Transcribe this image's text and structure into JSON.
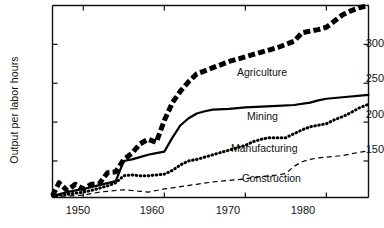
{
  "chart_data": {
    "type": "line",
    "title": "",
    "xlabel": "",
    "ylabel": "Output per labor hours",
    "xlim": [
      1946.2,
      1985.2
    ],
    "ylim": [
      103,
      350
    ],
    "grid": false,
    "legend_position": "inline-right",
    "xticks": [
      1950,
      1960,
      1970,
      1980
    ],
    "xtick_labels": [
      "1950",
      "1960",
      "1970",
      "1980"
    ],
    "yticks": [
      150,
      200,
      250,
      300
    ],
    "ytick_labels": [
      "150",
      "200",
      "250",
      "300"
    ],
    "series": [
      {
        "name": "Agriculture",
        "style": "thick-dashed",
        "color": "#000000",
        "x": [
          1946.2,
          1947,
          1948,
          1949,
          1950,
          1951,
          1952,
          1953,
          1954,
          1955,
          1956,
          1957,
          1958,
          1959,
          1960,
          1961,
          1962,
          1963,
          1964,
          1965,
          1966,
          1967,
          1968,
          1969,
          1970,
          1971,
          1972,
          1973,
          1974,
          1975,
          1976,
          1977,
          1978,
          1979,
          1980,
          1981,
          1982,
          1983,
          1984,
          1985.2
        ],
        "values": [
          105,
          122,
          112,
          120,
          114,
          120,
          121,
          135,
          136,
          152,
          160,
          172,
          178,
          174,
          202,
          225,
          240,
          252,
          262,
          266,
          270,
          274,
          278,
          281,
          284,
          287,
          290,
          293,
          296,
          300,
          304,
          315,
          317,
          319,
          322,
          330,
          338,
          343,
          347,
          350
        ]
      },
      {
        "name": "Mining",
        "style": "solid",
        "color": "#000000",
        "x": [
          1946.2,
          1948,
          1950,
          1952,
          1954,
          1955,
          1956,
          1957,
          1958,
          1959,
          1960,
          1961,
          1962,
          1963,
          1964,
          1965,
          1966,
          1968,
          1970,
          1972,
          1974,
          1976,
          1978,
          1979,
          1980,
          1982,
          1985.2
        ],
        "values": [
          105,
          110,
          114,
          119,
          124,
          150,
          152,
          155,
          158,
          160,
          162,
          180,
          196,
          205,
          211,
          214,
          216,
          217,
          219,
          220,
          221,
          222,
          225,
          228,
          230,
          232,
          235
        ]
      },
      {
        "name": "Manufacturing",
        "style": "dotted",
        "color": "#000000",
        "x": [
          1946.2,
          1948,
          1950,
          1951,
          1952,
          1953,
          1954,
          1955,
          1956,
          1957,
          1958,
          1959,
          1960,
          1961,
          1962,
          1963,
          1964,
          1965,
          1966,
          1967,
          1968,
          1969,
          1970,
          1971,
          1972,
          1973,
          1974,
          1975,
          1976,
          1977,
          1978,
          1979,
          1980,
          1981,
          1982,
          1983,
          1984,
          1985.2
        ],
        "values": [
          105,
          107,
          110,
          112,
          115,
          118,
          122,
          131,
          132,
          131,
          131,
          132,
          133,
          138,
          145,
          150,
          152,
          155,
          158,
          161,
          164,
          167,
          170,
          175,
          178,
          180,
          180,
          180,
          185,
          190,
          194,
          196,
          198,
          203,
          207,
          212,
          218,
          223
        ]
      },
      {
        "name": "Construction",
        "style": "dashed",
        "color": "#000000",
        "x": [
          1946.2,
          1948,
          1950,
          1951,
          1952,
          1953,
          1954,
          1955,
          1956,
          1957,
          1958,
          1959,
          1960,
          1962,
          1964,
          1966,
          1968,
          1970,
          1972,
          1973,
          1974,
          1975,
          1976,
          1977,
          1978,
          1979,
          1980,
          1982,
          1984,
          1985.2
        ],
        "values": [
          104,
          105,
          106,
          108,
          110,
          111,
          112,
          113,
          112,
          111,
          110,
          112,
          114,
          117,
          120,
          123,
          125,
          127,
          130,
          131,
          132,
          134,
          143,
          149,
          152,
          154,
          155,
          157,
          161,
          163
        ]
      }
    ]
  },
  "axis": {
    "ylabel": "Output per labor hours",
    "ytick_labels": [
      "300",
      "250",
      "200",
      "150"
    ],
    "xtick_labels": [
      "1950",
      "1960",
      "1970",
      "1980"
    ]
  },
  "series_labels": {
    "agriculture": "Agriculture",
    "mining": "Mining",
    "manufacturing": "Manufacturing",
    "construction": "Construction"
  }
}
